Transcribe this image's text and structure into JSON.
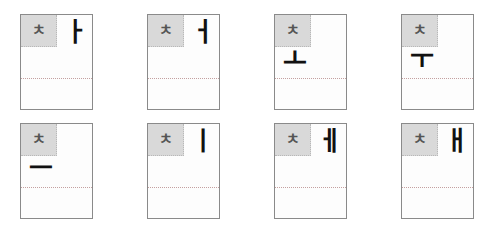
{
  "cards": [
    {
      "consonant": "ㅊ",
      "vowel": "ㅏ",
      "placement": "right"
    },
    {
      "consonant": "ㅊ",
      "vowel": "ㅓ",
      "placement": "right"
    },
    {
      "consonant": "ㅊ",
      "vowel": "ㅗ",
      "placement": "below"
    },
    {
      "consonant": "ㅊ",
      "vowel": "ㅜ",
      "placement": "below"
    },
    {
      "consonant": "ㅊ",
      "vowel": "ㅡ",
      "placement": "below"
    },
    {
      "consonant": "ㅊ",
      "vowel": "ㅣ",
      "placement": "right"
    },
    {
      "consonant": "ㅊ",
      "vowel": "ㅔ",
      "placement": "right"
    },
    {
      "consonant": "ㅊ",
      "vowel": "ㅐ",
      "placement": "right"
    }
  ]
}
